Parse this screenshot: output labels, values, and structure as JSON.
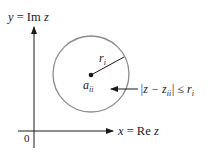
{
  "diagram": {
    "y_axis_label": {
      "y": "y",
      "eq": " = Im ",
      "z": "z"
    },
    "x_axis_label": {
      "x": "x",
      "eq": " = Re ",
      "z": "z"
    },
    "origin_label": "0",
    "radius_label": {
      "base": "r",
      "sub": "i"
    },
    "center_label": {
      "base": "a",
      "sub": "ii"
    },
    "inequality": {
      "left": "|z − z",
      "sub": "ii",
      "mid": "| ≤ r",
      "sub2": "i"
    },
    "colors": {
      "axis": "#1a1a1a",
      "circle": "#8c8c8c",
      "text": "#1a1a1a"
    }
  }
}
